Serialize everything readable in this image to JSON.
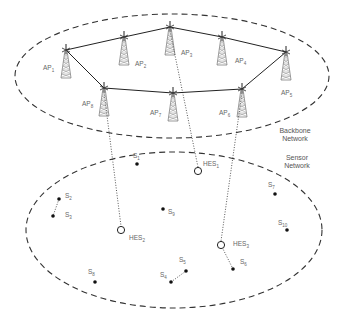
{
  "diagram": {
    "regions": [
      {
        "id": "backbone",
        "label_line1": "Backbone",
        "label_line2": "Network",
        "cx": 172,
        "cy": 76,
        "rx": 157,
        "ry": 62
      },
      {
        "id": "sensor",
        "label_line1": "Sensor",
        "label_line2": "Network",
        "cx": 174,
        "cy": 230,
        "rx": 148,
        "ry": 78
      }
    ],
    "access_points": [
      {
        "id": "AP1",
        "base": "AP",
        "sub": "1",
        "x": 66,
        "y": 50,
        "lx": 43,
        "ly": 70
      },
      {
        "id": "AP2",
        "base": "AP",
        "sub": "2",
        "x": 124,
        "y": 37,
        "lx": 135,
        "ly": 66
      },
      {
        "id": "AP3",
        "base": "AP",
        "sub": "3",
        "x": 170,
        "y": 27,
        "lx": 181,
        "ly": 55
      },
      {
        "id": "AP4",
        "base": "AP",
        "sub": "4",
        "x": 222,
        "y": 37,
        "lx": 235,
        "ly": 63
      },
      {
        "id": "AP5",
        "base": "AP",
        "sub": "5",
        "x": 286,
        "y": 52,
        "lx": 281,
        "ly": 95
      },
      {
        "id": "AP6",
        "base": "AP",
        "sub": "6",
        "x": 242,
        "y": 89,
        "lx": 219,
        "ly": 115
      },
      {
        "id": "AP7",
        "base": "AP",
        "sub": "7",
        "x": 173,
        "y": 93,
        "lx": 150,
        "ly": 115
      },
      {
        "id": "AP8",
        "base": "AP",
        "sub": "8",
        "x": 104,
        "y": 88,
        "lx": 82,
        "ly": 106
      }
    ],
    "backbone_links": [
      [
        "AP1",
        "AP2"
      ],
      [
        "AP2",
        "AP3"
      ],
      [
        "AP3",
        "AP4"
      ],
      [
        "AP4",
        "AP5"
      ],
      [
        "AP5",
        "AP6"
      ],
      [
        "AP6",
        "AP7"
      ],
      [
        "AP7",
        "AP8"
      ],
      [
        "AP8",
        "AP1"
      ]
    ],
    "hes_nodes": [
      {
        "id": "HES1",
        "base": "HES",
        "sub": "1",
        "x": 198,
        "y": 171,
        "lx": 203,
        "ly": 166,
        "uplink": "AP3"
      },
      {
        "id": "HES2",
        "base": "HES",
        "sub": "2",
        "x": 121,
        "y": 230,
        "lx": 129,
        "ly": 240,
        "uplink": "AP8"
      },
      {
        "id": "HES3",
        "base": "HES",
        "sub": "3",
        "x": 221,
        "y": 245,
        "lx": 233,
        "ly": 246,
        "uplink": "AP6"
      }
    ],
    "sensors": [
      {
        "id": "S1",
        "base": "S",
        "sub": "1",
        "x": 137,
        "y": 164,
        "lx": 133,
        "ly": 158
      },
      {
        "id": "S2",
        "base": "S",
        "sub": "2",
        "x": 59,
        "y": 199,
        "lx": 65,
        "ly": 198
      },
      {
        "id": "S3",
        "base": "S",
        "sub": "3",
        "x": 53,
        "y": 216,
        "lx": 65,
        "ly": 217
      },
      {
        "id": "S4",
        "base": "S",
        "sub": "4",
        "x": 171,
        "y": 282,
        "lx": 160,
        "ly": 277
      },
      {
        "id": "S5",
        "base": "S",
        "sub": "5",
        "x": 186,
        "y": 271,
        "lx": 179,
        "ly": 262
      },
      {
        "id": "S6",
        "base": "S",
        "sub": "6",
        "x": 233,
        "y": 269,
        "lx": 240,
        "ly": 264
      },
      {
        "id": "S7",
        "base": "S",
        "sub": "7",
        "x": 275,
        "y": 194,
        "lx": 268,
        "ly": 187
      },
      {
        "id": "S8",
        "base": "S",
        "sub": "8",
        "x": 95,
        "y": 282,
        "lx": 88,
        "ly": 274
      },
      {
        "id": "S9",
        "base": "S",
        "sub": "9",
        "x": 163,
        "y": 209,
        "lx": 168,
        "ly": 214
      },
      {
        "id": "S10",
        "base": "S",
        "sub": "10",
        "x": 287,
        "y": 230,
        "lx": 278,
        "ly": 225
      }
    ],
    "sensor_links": [
      [
        "S2",
        "S3"
      ],
      [
        "S4",
        "S5"
      ],
      [
        "HES3",
        "S6"
      ]
    ]
  }
}
